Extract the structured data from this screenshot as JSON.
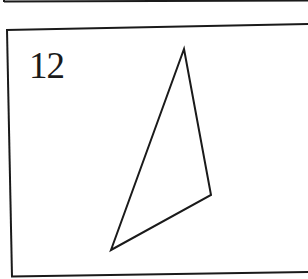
{
  "problem": {
    "number": "12"
  },
  "figure": {
    "shape": "triangle",
    "vertices": [
      [
        184,
        49
      ],
      [
        211,
        195
      ],
      [
        111,
        250
      ]
    ],
    "stroke_color": "#1a1a1a"
  },
  "frames": {
    "previous_box_bottom_visible": true,
    "current_box_left_border_visible": true,
    "current_box_right_border_visible": false
  }
}
